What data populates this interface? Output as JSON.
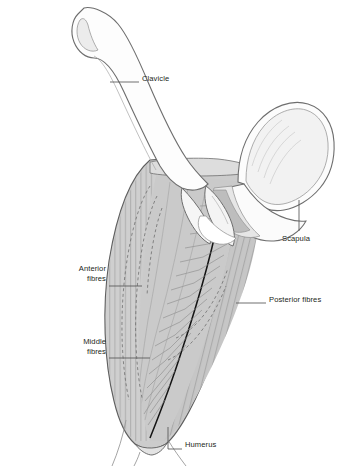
{
  "page": {
    "width": 343,
    "height": 466,
    "background": "#ffffff",
    "figure_subject": "deltoid-muscle-anterior-view",
    "title": ""
  },
  "chapter_tab": {
    "number": "2",
    "background_color": "#d2d2d2",
    "number_color": "#ffffff",
    "thumbnail_icon": "shoulder-anatomy-thumbnail"
  },
  "labels": [
    {
      "id": "clavicle",
      "text": "Clavicle",
      "align": "left"
    },
    {
      "id": "scapula",
      "text": "Scapula",
      "align": "left"
    },
    {
      "id": "posterior",
      "text": "Posterior fibres",
      "align": "left"
    },
    {
      "id": "humerus",
      "text": "Humerus",
      "align": "left"
    },
    {
      "id": "anterior",
      "text": "Anterior\nfibres",
      "align": "right",
      "line1": "Anterior",
      "line2": "fibres"
    },
    {
      "id": "middle",
      "text": "Middle\nfibres",
      "align": "right",
      "line1": "Middle",
      "line2": "fibres"
    }
  ],
  "colors": {
    "muscle_fill": "#c9c9c9",
    "muscle_fill_light": "#d6d6d6",
    "bone_fill": "#fbfbfb",
    "bone_fill_shadow": "#eaeaea",
    "outline": "#6e6e6e",
    "outline_dark": "#1a1a1a",
    "striation": "#8c8c8c",
    "leader_line": "#555555",
    "text": "#231f20",
    "tab_gray": "#d2d2d2"
  },
  "anatomy_parts": [
    {
      "name": "clavicle",
      "label": "Clavicle"
    },
    {
      "name": "scapula",
      "label": "Scapula"
    },
    {
      "name": "acromion",
      "label": ""
    },
    {
      "name": "coracoid-process",
      "label": ""
    },
    {
      "name": "humerus",
      "label": "Humerus"
    },
    {
      "name": "deltoid-anterior",
      "label": "Anterior fibres"
    },
    {
      "name": "deltoid-middle",
      "label": "Middle fibres"
    },
    {
      "name": "deltoid-posterior",
      "label": "Posterior fibres"
    }
  ]
}
